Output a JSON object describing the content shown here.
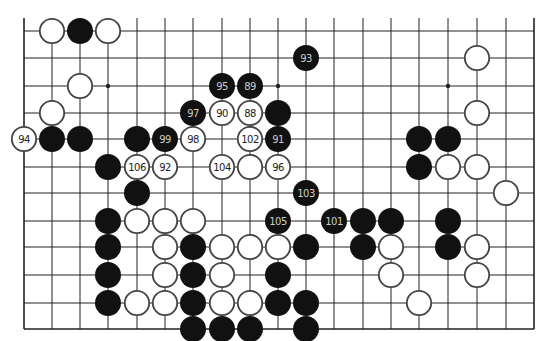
{
  "board": {
    "columns_x": [
      24,
      52,
      80,
      108,
      137,
      165,
      193,
      222,
      250,
      278,
      306,
      334,
      363,
      391,
      419,
      448,
      477,
      506,
      534
    ],
    "rows_y": [
      31,
      58,
      86,
      113,
      139,
      167,
      193,
      221,
      247,
      275,
      303,
      329
    ],
    "top_extension_y": 18,
    "line_color": "#222222",
    "stone_radius": 13,
    "black_color": "#111111",
    "black_label_color": "#cccccc",
    "white_color": "#ffffff",
    "white_outline_color": "#444444",
    "white_label_color": "#222222"
  },
  "star_points": [
    {
      "col": 3,
      "row": 2
    },
    {
      "col": 9,
      "row": 2
    },
    {
      "col": 15,
      "row": 2
    }
  ],
  "stones": [
    {
      "color": "white",
      "col": 1,
      "row": 0,
      "label": ""
    },
    {
      "color": "black",
      "col": 2,
      "row": 0,
      "label": ""
    },
    {
      "color": "white",
      "col": 3,
      "row": 0,
      "label": ""
    },
    {
      "color": "black",
      "col": 10,
      "row": 1,
      "label": "93"
    },
    {
      "color": "white",
      "col": 16,
      "row": 1,
      "label": ""
    },
    {
      "color": "white",
      "col": 2,
      "row": 2,
      "label": ""
    },
    {
      "color": "black",
      "col": 7,
      "row": 2,
      "label": "95"
    },
    {
      "color": "black",
      "col": 8,
      "row": 2,
      "label": "89"
    },
    {
      "color": "white",
      "col": 1,
      "row": 3,
      "label": ""
    },
    {
      "color": "black",
      "col": 6,
      "row": 3,
      "label": "97"
    },
    {
      "color": "white",
      "col": 7,
      "row": 3,
      "label": "90"
    },
    {
      "color": "white",
      "col": 8,
      "row": 3,
      "label": "88"
    },
    {
      "color": "black",
      "col": 9,
      "row": 3,
      "label": ""
    },
    {
      "color": "white",
      "col": 16,
      "row": 3,
      "label": ""
    },
    {
      "color": "white",
      "col": 0,
      "row": 4,
      "label": "94"
    },
    {
      "color": "black",
      "col": 1,
      "row": 4,
      "label": ""
    },
    {
      "color": "black",
      "col": 2,
      "row": 4,
      "label": ""
    },
    {
      "color": "black",
      "col": 4,
      "row": 4,
      "label": ""
    },
    {
      "color": "black",
      "col": 5,
      "row": 4,
      "label": "99"
    },
    {
      "color": "white",
      "col": 6,
      "row": 4,
      "label": "98"
    },
    {
      "color": "white",
      "col": 8,
      "row": 4,
      "label": "102"
    },
    {
      "color": "black",
      "col": 9,
      "row": 4,
      "label": "91"
    },
    {
      "color": "black",
      "col": 14,
      "row": 4,
      "label": ""
    },
    {
      "color": "black",
      "col": 15,
      "row": 4,
      "label": ""
    },
    {
      "color": "black",
      "col": 3,
      "row": 5,
      "label": ""
    },
    {
      "color": "white",
      "col": 4,
      "row": 5,
      "label": "106"
    },
    {
      "color": "white",
      "col": 5,
      "row": 5,
      "label": "92"
    },
    {
      "color": "white",
      "col": 7,
      "row": 5,
      "label": "104"
    },
    {
      "color": "white",
      "col": 8,
      "row": 5,
      "label": ""
    },
    {
      "color": "white",
      "col": 9,
      "row": 5,
      "label": "96"
    },
    {
      "color": "black",
      "col": 14,
      "row": 5,
      "label": ""
    },
    {
      "color": "white",
      "col": 15,
      "row": 5,
      "label": ""
    },
    {
      "color": "white",
      "col": 16,
      "row": 5,
      "label": ""
    },
    {
      "color": "black",
      "col": 4,
      "row": 6,
      "label": ""
    },
    {
      "color": "black",
      "col": 10,
      "row": 6,
      "label": "103"
    },
    {
      "color": "white",
      "col": 17,
      "row": 6,
      "label": ""
    },
    {
      "color": "black",
      "col": 3,
      "row": 7,
      "label": ""
    },
    {
      "color": "white",
      "col": 4,
      "row": 7,
      "label": ""
    },
    {
      "color": "white",
      "col": 5,
      "row": 7,
      "label": ""
    },
    {
      "color": "white",
      "col": 6,
      "row": 7,
      "label": ""
    },
    {
      "color": "black",
      "col": 9,
      "row": 7,
      "label": "105"
    },
    {
      "color": "black",
      "col": 11,
      "row": 7,
      "label": "101"
    },
    {
      "color": "black",
      "col": 12,
      "row": 7,
      "label": ""
    },
    {
      "color": "black",
      "col": 13,
      "row": 7,
      "label": ""
    },
    {
      "color": "black",
      "col": 15,
      "row": 7,
      "label": ""
    },
    {
      "color": "black",
      "col": 3,
      "row": 8,
      "label": ""
    },
    {
      "color": "white",
      "col": 5,
      "row": 8,
      "label": ""
    },
    {
      "color": "black",
      "col": 6,
      "row": 8,
      "label": ""
    },
    {
      "color": "white",
      "col": 7,
      "row": 8,
      "label": ""
    },
    {
      "color": "white",
      "col": 8,
      "row": 8,
      "label": ""
    },
    {
      "color": "white",
      "col": 9,
      "row": 8,
      "label": ""
    },
    {
      "color": "black",
      "col": 10,
      "row": 8,
      "label": ""
    },
    {
      "color": "black",
      "col": 12,
      "row": 8,
      "label": ""
    },
    {
      "color": "white",
      "col": 13,
      "row": 8,
      "label": ""
    },
    {
      "color": "black",
      "col": 15,
      "row": 8,
      "label": ""
    },
    {
      "color": "white",
      "col": 16,
      "row": 8,
      "label": ""
    },
    {
      "color": "black",
      "col": 3,
      "row": 9,
      "label": ""
    },
    {
      "color": "white",
      "col": 5,
      "row": 9,
      "label": ""
    },
    {
      "color": "black",
      "col": 6,
      "row": 9,
      "label": ""
    },
    {
      "color": "white",
      "col": 7,
      "row": 9,
      "label": ""
    },
    {
      "color": "black",
      "col": 9,
      "row": 9,
      "label": ""
    },
    {
      "color": "white",
      "col": 13,
      "row": 9,
      "label": ""
    },
    {
      "color": "white",
      "col": 16,
      "row": 9,
      "label": ""
    },
    {
      "color": "black",
      "col": 3,
      "row": 10,
      "label": ""
    },
    {
      "color": "white",
      "col": 4,
      "row": 10,
      "label": ""
    },
    {
      "color": "white",
      "col": 5,
      "row": 10,
      "label": ""
    },
    {
      "color": "black",
      "col": 6,
      "row": 10,
      "label": ""
    },
    {
      "color": "white",
      "col": 7,
      "row": 10,
      "label": ""
    },
    {
      "color": "white",
      "col": 8,
      "row": 10,
      "label": ""
    },
    {
      "color": "black",
      "col": 9,
      "row": 10,
      "label": ""
    },
    {
      "color": "black",
      "col": 10,
      "row": 10,
      "label": ""
    },
    {
      "color": "white",
      "col": 14,
      "row": 10,
      "label": ""
    },
    {
      "color": "black",
      "col": 6,
      "row": 11,
      "label": ""
    },
    {
      "color": "black",
      "col": 7,
      "row": 11,
      "label": ""
    },
    {
      "color": "black",
      "col": 8,
      "row": 11,
      "label": ""
    },
    {
      "color": "black",
      "col": 10,
      "row": 11,
      "label": ""
    }
  ]
}
